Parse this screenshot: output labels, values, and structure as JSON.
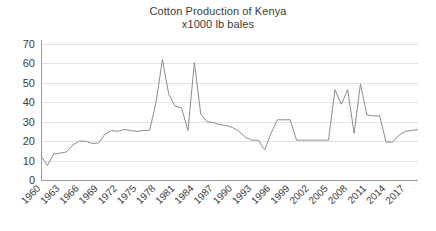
{
  "chart_data": {
    "type": "line",
    "title": "Cotton Production of Kenya",
    "subtitle": "x1000 lb bales",
    "xlabel": "",
    "ylabel": "",
    "ylim": [
      0,
      70
    ],
    "ytick_step": 10,
    "yticks": [
      0,
      10,
      20,
      30,
      40,
      50,
      60,
      70
    ],
    "ytick_labels": [
      "0",
      "10",
      "20",
      "30",
      "40",
      "50",
      "60",
      "70"
    ],
    "xlim": [
      1960,
      2019
    ],
    "xtick_step": 3,
    "xticks": [
      1960,
      1963,
      1966,
      1969,
      1972,
      1975,
      1978,
      1981,
      1984,
      1987,
      1990,
      1993,
      1996,
      1999,
      2002,
      2005,
      2008,
      2011,
      2014,
      2017
    ],
    "xtick_labels": [
      "1960",
      "1963",
      "1966",
      "1969",
      "1972",
      "1975",
      "1978",
      "1981",
      "1984",
      "1987",
      "1990",
      "1993",
      "1996",
      "1999",
      "2002",
      "2005",
      "2008",
      "2011",
      "2014",
      "2017"
    ],
    "xtick_label_rotation": -45,
    "grid": "horizontal",
    "legend": "none",
    "line_color": "#8c8c8c",
    "grid_color": "#e2e2e2",
    "axis_color": "#9a9a9a",
    "x": [
      1960,
      1961,
      1962,
      1963,
      1964,
      1965,
      1966,
      1967,
      1968,
      1969,
      1970,
      1971,
      1972,
      1973,
      1974,
      1975,
      1976,
      1977,
      1978,
      1979,
      1980,
      1981,
      1982,
      1983,
      1984,
      1985,
      1986,
      1987,
      1988,
      1989,
      1990,
      1991,
      1992,
      1993,
      1994,
      1995,
      1996,
      1997,
      1998,
      1999,
      2000,
      2001,
      2002,
      2003,
      2004,
      2005,
      2006,
      2007,
      2008,
      2009,
      2010,
      2011,
      2012,
      2013,
      2014,
      2015,
      2016,
      2017,
      2018,
      2019
    ],
    "values": [
      12.5,
      7.5,
      13.5,
      13.8,
      14.5,
      18.0,
      20.0,
      20.0,
      18.8,
      19.0,
      23.5,
      25.5,
      25.0,
      26.0,
      25.5,
      25.0,
      25.5,
      25.5,
      40.0,
      62.0,
      44.0,
      38.0,
      37.0,
      25.5,
      60.5,
      34.0,
      30.0,
      29.5,
      28.5,
      28.0,
      27.0,
      25.0,
      22.0,
      20.5,
      20.5,
      15.5,
      24.0,
      31.0,
      31.0,
      31.0,
      20.5,
      20.5,
      20.5,
      20.5,
      20.5,
      20.5,
      46.5,
      39.0,
      46.5,
      24.0,
      49.5,
      33.5,
      33.0,
      33.0,
      19.5,
      19.5,
      23.0,
      25.0,
      25.5,
      26.0
    ],
    "series_name": "Cotton Production"
  },
  "plot_geometry": {
    "left": 41,
    "right": 418,
    "top": 44,
    "bottom": 180
  }
}
